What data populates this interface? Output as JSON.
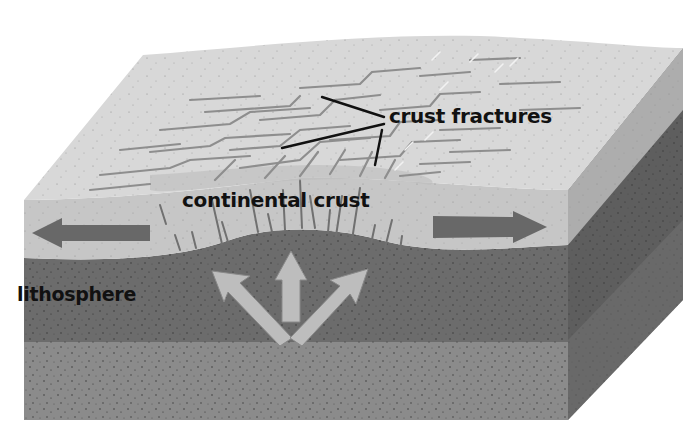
{
  "diagram": {
    "labels": {
      "crust_fractures": "crust fractures",
      "continental_crust": "continental crust",
      "lithosphere": "lithosphere"
    },
    "layers": [
      {
        "name": "continental crust",
        "color": "#c9c9c9"
      },
      {
        "name": "lithosphere",
        "color": "#6e6e6e"
      },
      {
        "name": "asthenosphere",
        "color": "#8a8a8a"
      }
    ],
    "arrows": [
      {
        "name": "left-pull-arrow",
        "direction": "left",
        "color": "#6a6a6a"
      },
      {
        "name": "right-pull-arrow",
        "direction": "right",
        "color": "#6a6a6a"
      },
      {
        "name": "upwelling-arrows",
        "direction": "up-and-out",
        "color": "#bdbdbd"
      }
    ],
    "colors": {
      "background": "#ffffff",
      "top_surface": "#d6d6d6",
      "crust_front": "#c4c4c4",
      "side_crust": "#a9a9a9",
      "side_mantle": "#5c5c5c",
      "fracture": "#8c8c8c",
      "leader_line": "#111111"
    }
  }
}
